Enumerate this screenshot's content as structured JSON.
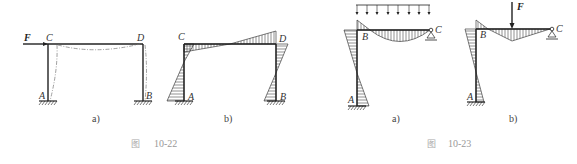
{
  "figures": [
    {
      "id": "fig-10-22",
      "caption_prefix": "图",
      "caption_number": "10-22",
      "panels": [
        {
          "sub_label": "a)",
          "force_label": "F",
          "node_labels": {
            "A": "A",
            "B": "B",
            "C": "C",
            "D": "D"
          },
          "description": "Portal frame with horizontal force F at C; dashed deflected shape"
        },
        {
          "sub_label": "b)",
          "node_labels": {
            "A": "A",
            "B": "B",
            "C": "C",
            "D": "D"
          },
          "description": "Bending moment diagram of portal frame (hatched)"
        }
      ]
    },
    {
      "id": "fig-10-23",
      "caption_prefix": "图",
      "caption_number": "10-23",
      "panels": [
        {
          "sub_label": "a)",
          "load": "uniformly distributed load",
          "node_labels": {
            "A": "A",
            "B": "B",
            "C": "C"
          },
          "description": "L-frame under distributed load, bending moment diagram"
        },
        {
          "sub_label": "b)",
          "force_label": "F",
          "node_labels": {
            "A": "A",
            "B": "B",
            "C": "C"
          },
          "description": "L-frame under point load F, bending moment diagram"
        }
      ]
    }
  ],
  "colors": {
    "line": "#222222",
    "hatch": "#444444",
    "caption": "#999999"
  }
}
